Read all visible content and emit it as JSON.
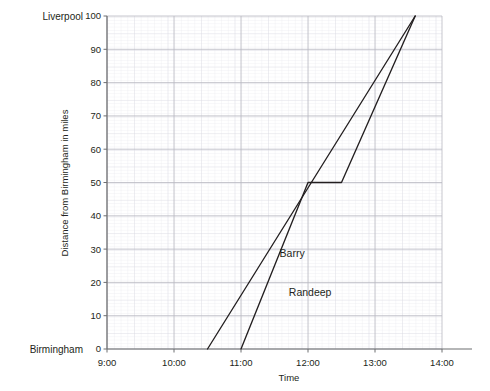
{
  "chart_data": {
    "type": "line",
    "title": "",
    "xlabel": "Time",
    "ylabel": "Distance from Birmingham in miles",
    "xlim": [
      9,
      14
    ],
    "ylim": [
      0,
      100
    ],
    "grid": true,
    "grid_minor": true,
    "legend": "inline-labels",
    "x_tick_labels": [
      "9:00",
      "10:00",
      "11:00",
      "12:00",
      "13:00",
      "14:00"
    ],
    "x_tick_values": [
      9,
      10,
      11,
      12,
      13,
      14
    ],
    "y_tick_labels": [
      "0",
      "10",
      "20",
      "30",
      "40",
      "50",
      "60",
      "70",
      "80",
      "90",
      "100"
    ],
    "y_tick_values": [
      0,
      10,
      20,
      30,
      40,
      50,
      60,
      70,
      80,
      90,
      100
    ],
    "y_endpoint_labels": [
      {
        "value": 100,
        "text": "Liverpool"
      },
      {
        "value": 0,
        "text": "Birmingham"
      }
    ],
    "series": [
      {
        "name": "Barry",
        "color": "#231f20",
        "label_x": 11.95,
        "label_y": 27.5,
        "points": [
          {
            "x": 10.5,
            "y": 0
          },
          {
            "x": 13.6,
            "y": 100
          }
        ]
      },
      {
        "name": "Randeep",
        "color": "#231f20",
        "label_x": 12.35,
        "label_y": 16.0,
        "points": [
          {
            "x": 11.0,
            "y": 0
          },
          {
            "x": 12.0,
            "y": 50
          },
          {
            "x": 12.5,
            "y": 50
          },
          {
            "x": 13.6,
            "y": 100
          }
        ]
      }
    ],
    "annotations": []
  },
  "axes": {
    "x_axis_title": "Time",
    "y_axis_title": "Distance from Birmingham in miles"
  }
}
